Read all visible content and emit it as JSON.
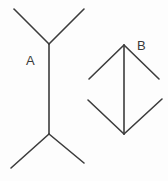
{
  "figure": {
    "type": "muller-lyer-illusion",
    "stroke_color": "#3c3c3c",
    "figures": [
      {
        "label": "A",
        "label_pos": [
          31,
          60
        ],
        "shaft": [
          [
            49,
            44
          ],
          [
            49,
            134
          ]
        ],
        "arms": [
          [
            [
              49,
              44
            ],
            [
              14,
              9
            ]
          ],
          [
            [
              49,
              44
            ],
            [
              84,
              9
            ]
          ],
          [
            [
              49,
              134
            ],
            [
              11,
              168
            ]
          ],
          [
            [
              49,
              134
            ],
            [
              84,
              163
            ]
          ]
        ]
      },
      {
        "label": "B",
        "label_pos": [
          141,
          45
        ],
        "shaft": [
          [
            124,
            45
          ],
          [
            124,
            134
          ]
        ],
        "arms": [
          [
            [
              124,
              45
            ],
            [
              89,
              79
            ]
          ],
          [
            [
              124,
              45
            ],
            [
              159,
              79
            ]
          ],
          [
            [
              124,
              134
            ],
            [
              88,
              100
            ]
          ],
          [
            [
              124,
              134
            ],
            [
              162,
              99
            ]
          ]
        ]
      }
    ]
  }
}
